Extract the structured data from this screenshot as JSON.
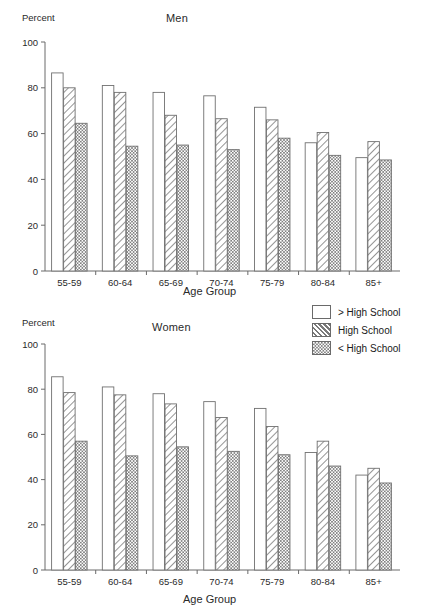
{
  "chart_data": [
    {
      "type": "bar",
      "title": "Men",
      "xlabel": "Age Group",
      "ylabel": "Percent",
      "ylim": [
        0,
        100
      ],
      "yticks": [
        0,
        20,
        40,
        60,
        80,
        100
      ],
      "grid": false,
      "legend_position": "right",
      "categories": [
        "55-59",
        "60-64",
        "65-69",
        "70-74",
        "75-79",
        "80-84",
        "85+"
      ],
      "series": [
        {
          "name": "> High School",
          "pattern": "solid-white",
          "values": [
            86.5,
            81,
            78,
            76.5,
            71.5,
            56,
            49.5
          ]
        },
        {
          "name": "High School",
          "pattern": "diagonal-hatch",
          "values": [
            80,
            78,
            68,
            66.5,
            66,
            60.5,
            56.5
          ]
        },
        {
          "name": "< High School",
          "pattern": "checkered",
          "values": [
            64.5,
            54.5,
            55,
            53,
            58,
            50.5,
            48.5
          ]
        }
      ]
    },
    {
      "type": "bar",
      "title": "Women",
      "xlabel": "Age Group",
      "ylabel": "Percent",
      "ylim": [
        0,
        100
      ],
      "yticks": [
        0,
        20,
        40,
        60,
        80,
        100
      ],
      "grid": false,
      "legend_position": "right",
      "categories": [
        "55-59",
        "60-64",
        "65-69",
        "70-74",
        "75-79",
        "80-84",
        "85+"
      ],
      "series": [
        {
          "name": "> High School",
          "pattern": "solid-white",
          "values": [
            85.5,
            81,
            78,
            74.5,
            71.5,
            52,
            42
          ]
        },
        {
          "name": "High School",
          "pattern": "diagonal-hatch",
          "values": [
            78.5,
            77.5,
            73.5,
            67.5,
            63.5,
            57,
            45
          ]
        },
        {
          "name": "< High School",
          "pattern": "checkered",
          "values": [
            57,
            50.5,
            54.5,
            52.5,
            51,
            46,
            38.5
          ]
        }
      ]
    }
  ],
  "legend": {
    "items": [
      {
        "label": "> High School",
        "pattern": "solid-white"
      },
      {
        "label": "High School",
        "pattern": "diagonal-hatch"
      },
      {
        "label": "< High School",
        "pattern": "checkered"
      }
    ]
  }
}
